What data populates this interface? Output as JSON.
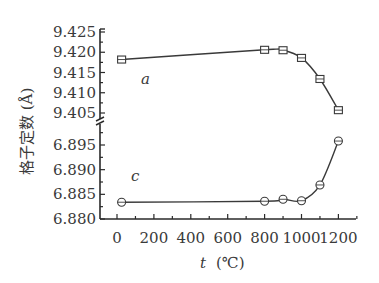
{
  "chart_data": {
    "type": "line",
    "title": "",
    "xlabel": "t (℃)",
    "xlabel_var": "t",
    "xlabel_unit": "(℃)",
    "ylabel": "格子定数 (Å)",
    "xlim": [
      -80,
      1300
    ],
    "x_ticks": [
      0,
      200,
      400,
      600,
      800,
      1000,
      1200
    ],
    "x_tick_labels": [
      "0",
      "200",
      "400",
      "600",
      "800",
      "1000",
      "1200"
    ],
    "broken_y_axis": true,
    "upper_panel": {
      "ylim": [
        9.405,
        9.425
      ],
      "y_ticks": [
        9.405,
        9.41,
        9.415,
        9.42,
        9.425
      ],
      "y_tick_labels": [
        "9.405",
        "9.410",
        "9.415",
        "9.420",
        "9.425"
      ]
    },
    "lower_panel": {
      "ylim": [
        6.88,
        6.895
      ],
      "y_ticks": [
        6.88,
        6.885,
        6.89,
        6.895
      ],
      "y_tick_labels": [
        "6.880",
        "6.885",
        "6.890",
        "6.895"
      ]
    },
    "grid": false,
    "legend": "inline labels",
    "series": [
      {
        "name": "a",
        "marker": "square",
        "panel": "upper",
        "x": [
          25,
          800,
          900,
          1000,
          1100,
          1200
        ],
        "values": [
          9.4182,
          9.4206,
          9.4205,
          9.4186,
          9.4134,
          9.4057
        ]
      },
      {
        "name": "c",
        "marker": "circle",
        "panel": "lower",
        "x": [
          25,
          800,
          900,
          1000,
          1100,
          1200
        ],
        "values": [
          6.8834,
          6.8836,
          6.884,
          6.8837,
          6.8869,
          6.8958
        ]
      }
    ],
    "colors": {
      "line": "#3a3a3a",
      "axis": "#2a2a2a",
      "background": "#ffffff"
    }
  }
}
